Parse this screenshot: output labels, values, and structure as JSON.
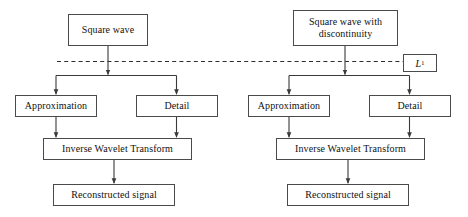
{
  "diagram": {
    "level_label": {
      "text": "L",
      "subscript": "1",
      "name": "level-1-label"
    },
    "left_branch": {
      "source": "Square wave",
      "approximation": "Approximation",
      "detail": "Detail",
      "transform": "Inverse Wavelet Transform",
      "output": "Reconstructed signal"
    },
    "right_branch": {
      "source_line1": "Square wave with",
      "source_line2": "discontinuity",
      "approximation": "Approximation",
      "detail": "Detail",
      "transform": "Inverse Wavelet Transform",
      "output": "Reconstructed signal"
    },
    "colors": {
      "border": "#4a4a4a",
      "wire": "#3a3a3a",
      "dashed": "#2e2e2e",
      "text": "#111111",
      "background": "#ffffff"
    }
  }
}
